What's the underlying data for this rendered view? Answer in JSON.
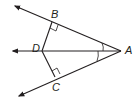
{
  "diagram": {
    "type": "geometry",
    "points": {
      "A": {
        "label": "A",
        "x": 121,
        "y": 51
      },
      "B": {
        "label": "B",
        "x": 52,
        "y": 22
      },
      "C": {
        "label": "C",
        "x": 55,
        "y": 77
      },
      "D": {
        "label": "D",
        "x": 42,
        "y": 51
      }
    },
    "rays": [
      {
        "from": "A",
        "through": "B",
        "arrow_end": {
          "x": 14,
          "y": 5
        }
      },
      {
        "from": "A",
        "through": "D",
        "arrow_end": {
          "x": 12,
          "y": 51
        }
      },
      {
        "from": "A",
        "through": "C",
        "arrow_end": {
          "x": 18,
          "y": 97
        }
      }
    ],
    "segments": [
      {
        "from": "D",
        "to": "B"
      },
      {
        "from": "D",
        "to": "C"
      }
    ],
    "right_angles": [
      "B",
      "C"
    ],
    "congruent_angles": [
      "BAD",
      "DAC"
    ],
    "stroke_color": "#231f20"
  }
}
